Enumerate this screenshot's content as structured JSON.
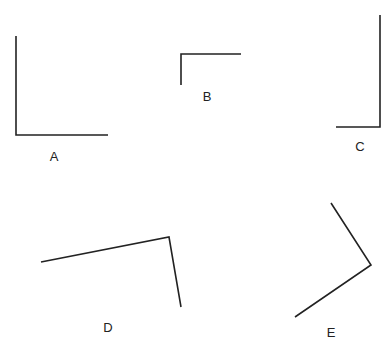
{
  "diagram": {
    "stroke_color": "#222222",
    "angles": [
      {
        "label": "A",
        "points": [
          [
            16,
            36
          ],
          [
            16,
            135
          ],
          [
            108,
            135
          ]
        ],
        "label_pos": [
          54,
          156
        ]
      },
      {
        "label": "B",
        "points": [
          [
            181,
            85
          ],
          [
            181,
            54
          ],
          [
            241,
            54
          ]
        ],
        "label_pos": [
          207,
          96
        ]
      },
      {
        "label": "C",
        "points": [
          [
            380,
            15
          ],
          [
            380,
            127
          ],
          [
            336,
            127
          ]
        ],
        "label_pos": [
          360,
          146
        ]
      },
      {
        "label": "D",
        "points": [
          [
            41,
            262
          ],
          [
            169,
            237
          ],
          [
            181,
            307
          ]
        ],
        "label_pos": [
          108,
          327
        ]
      },
      {
        "label": "E",
        "points": [
          [
            331,
            203
          ],
          [
            371,
            265
          ],
          [
            295,
            317
          ]
        ],
        "label_pos": [
          331,
          332
        ]
      }
    ]
  }
}
